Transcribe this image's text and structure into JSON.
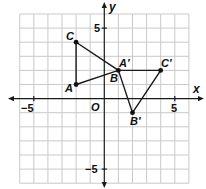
{
  "axes": {
    "x_label": "x",
    "y_label": "y",
    "origin_label": "O",
    "x_range": [
      -6,
      6
    ],
    "y_range": [
      -6,
      6
    ],
    "ticks": {
      "x_neg5": "−5",
      "x_pos5": "5",
      "y_pos5": "5",
      "y_neg5": "−5"
    }
  },
  "triangles": {
    "original": {
      "A": {
        "label": "A",
        "x": -2,
        "y": 1
      },
      "B": {
        "label": "B",
        "x": 1,
        "y": 2
      },
      "C": {
        "label": "C",
        "x": -2,
        "y": 4
      }
    },
    "image": {
      "A_prime": {
        "label": "A′",
        "x": 1,
        "y": 2
      },
      "B_prime": {
        "label": "B′",
        "x": 2,
        "y": -1
      },
      "C_prime": {
        "label": "C′",
        "x": 4,
        "y": 2
      }
    }
  },
  "colors": {
    "grid": "#c9c9c9",
    "ink": "#1a1a1a"
  }
}
